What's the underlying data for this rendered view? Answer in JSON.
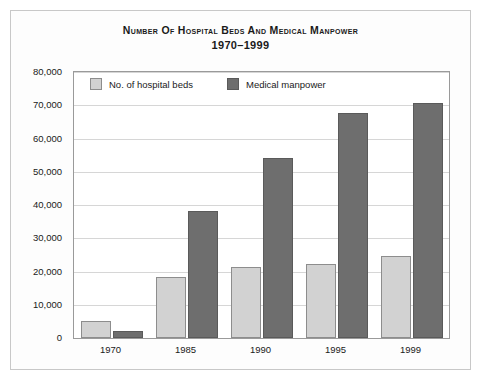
{
  "chart_data": {
    "type": "bar",
    "title": "Number of Hospital Beds and Medical Manpower",
    "subtitle": "1970–1999",
    "xlabel": "",
    "ylabel": "",
    "categories": [
      "1970",
      "1985",
      "1990",
      "1995",
      "1999"
    ],
    "series": [
      {
        "name": "No. of hospital beds",
        "color": "#d2d2d2",
        "values": [
          5000,
          18500,
          21500,
          22300,
          24800
        ]
      },
      {
        "name": "Medical manpower",
        "color": "#6e6e6e",
        "values": [
          2200,
          38300,
          54200,
          67800,
          70800
        ]
      }
    ],
    "ylim": [
      0,
      80000
    ],
    "ytick_values": [
      0,
      10000,
      20000,
      30000,
      40000,
      50000,
      60000,
      70000,
      80000
    ],
    "ytick_labels": [
      "0",
      "10,000",
      "20,000",
      "30,000",
      "40,000",
      "50,000",
      "60,000",
      "70,000",
      "80,000"
    ],
    "grid": true,
    "legend_position": "top-left-inside"
  },
  "style": {
    "bar_light": "#d2d2d2",
    "bar_dark": "#6e6e6e",
    "gridline": "#d6d6d6",
    "frame_border": "#9a9a9a",
    "figure_border": "#c8c8c8",
    "text": "#1a1a1a"
  }
}
